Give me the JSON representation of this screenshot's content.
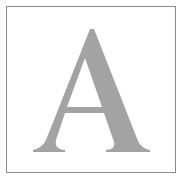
{
  "tile": {
    "letter": "A",
    "letter_color": "#a3a3a3",
    "border_color": "#8a8a8a",
    "background_color": "#ffffff"
  }
}
